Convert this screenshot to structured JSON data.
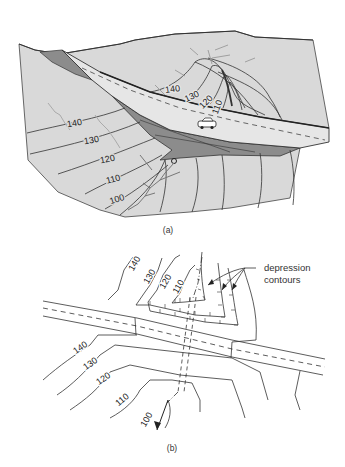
{
  "figure": {
    "panel_a": {
      "caption": "(a)",
      "contours_uphill": [
        {
          "label": "140",
          "x": 173,
          "y": 92,
          "rot": -8
        },
        {
          "label": "130",
          "x": 193,
          "y": 99,
          "rot": -25
        },
        {
          "label": "120",
          "x": 208,
          "y": 104,
          "rot": -45
        },
        {
          "label": "110",
          "x": 220,
          "y": 108,
          "rot": -70
        }
      ],
      "contours_downhill": [
        {
          "label": "140",
          "x": 75,
          "y": 126,
          "rot": -10
        },
        {
          "label": "130",
          "x": 92,
          "y": 143,
          "rot": -10
        },
        {
          "label": "120",
          "x": 108,
          "y": 162,
          "rot": -12
        },
        {
          "label": "110",
          "x": 114,
          "y": 182,
          "rot": -15
        },
        {
          "label": "100",
          "x": 118,
          "y": 202,
          "rot": -18
        }
      ],
      "colors": {
        "ground": "#d9d9d9",
        "cut_fill": "#8c8c8c",
        "road": "#e6e6e6",
        "line": "#333333",
        "stream": "#999999"
      }
    },
    "panel_b": {
      "caption": "(b)",
      "annotation": [
        "depression",
        "contours"
      ],
      "contours_upper": [
        {
          "label": "140",
          "x": 137,
          "y": 265,
          "rot": -60
        },
        {
          "label": "130",
          "x": 152,
          "y": 278,
          "rot": -60
        },
        {
          "label": "120",
          "x": 168,
          "y": 283,
          "rot": -60
        },
        {
          "label": "110",
          "x": 181,
          "y": 288,
          "rot": -60
        }
      ],
      "contours_lower": [
        {
          "label": "140",
          "x": 82,
          "y": 350,
          "rot": -35
        },
        {
          "label": "130",
          "x": 92,
          "y": 366,
          "rot": -35
        },
        {
          "label": "120",
          "x": 105,
          "y": 381,
          "rot": -35
        },
        {
          "label": "110",
          "x": 124,
          "y": 402,
          "rot": -40
        },
        {
          "label": "100",
          "x": 149,
          "y": 421,
          "rot": -60
        }
      ]
    }
  }
}
